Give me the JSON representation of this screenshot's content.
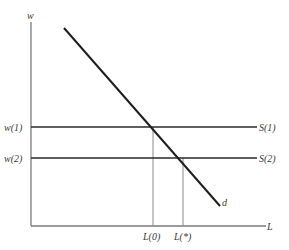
{
  "diagram": {
    "type": "labor-market-supply-demand",
    "axes": {
      "y_label": "w",
      "x_label": "L"
    },
    "supply_curves": [
      {
        "id": "S1",
        "label": "S(1)",
        "wage_label": "w(1)"
      },
      {
        "id": "S2",
        "label": "S(2)",
        "wage_label": "w(2)"
      }
    ],
    "demand_curve": {
      "label": "d"
    },
    "quantity_labels": [
      {
        "id": "L0",
        "label": "L(0)"
      },
      {
        "id": "Lstar",
        "label": "L(*)"
      }
    ],
    "colors": {
      "background": "#ffffff",
      "lines": "#2a2a2a",
      "axes": "#7a7a7a",
      "text": "#3a3a3a"
    }
  }
}
